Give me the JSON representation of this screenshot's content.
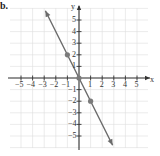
{
  "part_label": "b.",
  "chart_data": {
    "type": "line",
    "title": "",
    "xlabel": "x",
    "ylabel": "y",
    "xlim": [
      -5.5,
      5.5
    ],
    "ylim": [
      -5.8,
      5.8
    ],
    "grid": true,
    "x_ticks": [
      "−5",
      "−4",
      "−3",
      "−2",
      "−1",
      "1",
      "2",
      "3",
      "4",
      "5"
    ],
    "y_ticks": [
      "5",
      "4",
      "3",
      "2",
      "1",
      "−1",
      "−2",
      "−3",
      "−4",
      "−5"
    ],
    "series": [
      {
        "name": "line",
        "equation": "y = -2x",
        "color": "#666666",
        "arrows": "both",
        "x": [
          -2.9,
          2.9
        ],
        "y": [
          5.8,
          -5.8
        ]
      }
    ],
    "points": [
      {
        "x": -1,
        "y": 2
      },
      {
        "x": 0,
        "y": 0
      },
      {
        "x": 1,
        "y": -2
      }
    ],
    "colors": {
      "grid": "#dddddd",
      "axis": "#333333",
      "line": "#6b6b6b",
      "point": "#7a7a7a"
    }
  }
}
